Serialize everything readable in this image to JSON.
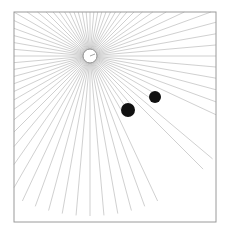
{
  "diagram": {
    "type": "ray-casting",
    "canvas": {
      "width": 229,
      "height": 232,
      "background": "#ffffff"
    },
    "frame": {
      "x": 14,
      "y": 12,
      "width": 202,
      "height": 210,
      "stroke": "#9a9a9a"
    },
    "light_source": {
      "cx": 90,
      "cy": 56,
      "r": 7,
      "fill": "#ffffff",
      "stroke": "#8a8a8a"
    },
    "rays": {
      "count": 72,
      "max_length": 160,
      "color": "#b0b0b0",
      "width": 0.6
    },
    "occluders": [
      {
        "cx": 128,
        "cy": 110,
        "r": 7,
        "fill": "#111111"
      },
      {
        "cx": 155,
        "cy": 97,
        "r": 6,
        "fill": "#111111"
      }
    ]
  }
}
